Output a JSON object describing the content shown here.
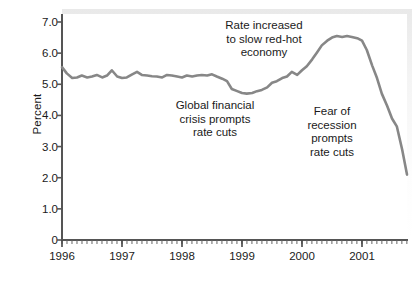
{
  "chart_data": {
    "type": "line",
    "title": "",
    "xlabel": "",
    "ylabel": "Percent",
    "xlim": [
      1996.0,
      2001.75
    ],
    "ylim": [
      0,
      7.0
    ],
    "grid": false,
    "legend": null,
    "line_color": "#878787",
    "y_ticks": [
      0,
      1.0,
      2.0,
      3.0,
      4.0,
      5.0,
      6.0,
      7.0
    ],
    "y_tick_labels": [
      "0",
      "1.0",
      "2.0",
      "3.0",
      "4.0",
      "5.0",
      "6.0",
      "7.0"
    ],
    "x_ticks": [
      1996,
      1997,
      1998,
      1999,
      2000,
      2001
    ],
    "x_tick_labels": [
      "1996",
      "1997",
      "1998",
      "1999",
      "2000",
      "2001"
    ],
    "x_minor_tick_interval": 0.0833,
    "series": [
      {
        "name": "Interest rate",
        "x": [
          1996.0,
          1996.08,
          1996.17,
          1996.25,
          1996.33,
          1996.42,
          1996.5,
          1996.58,
          1996.67,
          1996.75,
          1996.83,
          1996.92,
          1997.0,
          1997.08,
          1997.17,
          1997.25,
          1997.33,
          1997.42,
          1997.5,
          1997.58,
          1997.67,
          1997.75,
          1997.83,
          1997.92,
          1998.0,
          1998.08,
          1998.17,
          1998.25,
          1998.33,
          1998.42,
          1998.5,
          1998.58,
          1998.67,
          1998.75,
          1998.83,
          1998.92,
          1999.0,
          1999.08,
          1999.17,
          1999.25,
          1999.33,
          1999.42,
          1999.5,
          1999.58,
          1999.67,
          1999.75,
          1999.83,
          1999.92,
          2000.0,
          2000.08,
          2000.17,
          2000.25,
          2000.33,
          2000.42,
          2000.5,
          2000.58,
          2000.67,
          2000.75,
          2000.83,
          2000.92,
          2001.0,
          2001.08,
          2001.17,
          2001.25,
          2001.33,
          2001.42,
          2001.5,
          2001.58,
          2001.67,
          2001.75
        ],
        "y": [
          5.55,
          5.35,
          5.2,
          5.22,
          5.28,
          5.22,
          5.25,
          5.3,
          5.22,
          5.28,
          5.45,
          5.25,
          5.2,
          5.22,
          5.32,
          5.4,
          5.3,
          5.28,
          5.26,
          5.25,
          5.22,
          5.3,
          5.28,
          5.25,
          5.22,
          5.28,
          5.25,
          5.28,
          5.3,
          5.28,
          5.32,
          5.25,
          5.18,
          5.1,
          4.85,
          4.78,
          4.72,
          4.7,
          4.72,
          4.78,
          4.82,
          4.9,
          5.05,
          5.1,
          5.2,
          5.25,
          5.4,
          5.3,
          5.45,
          5.58,
          5.8,
          6.02,
          6.25,
          6.4,
          6.5,
          6.55,
          6.52,
          6.55,
          6.52,
          6.48,
          6.4,
          6.1,
          5.6,
          5.2,
          4.7,
          4.3,
          3.9,
          3.65,
          2.9,
          2.1
        ],
        "color": "#878787",
        "width": 2.6
      }
    ],
    "annotations": [
      {
        "id": "annotation-rate-increase",
        "text": "Rate increased\nto slow red-hot\neconomy",
        "left_px": 208,
        "top_px": 19,
        "width_px": 112
      },
      {
        "id": "annotation-global-financial-crisis",
        "text": "Global financial\ncrisis prompts\nrate cuts",
        "left_px": 163,
        "top_px": 99,
        "width_px": 104
      },
      {
        "id": "annotation-fear-of-recession",
        "text": "Fear of\nrecession\nprompts\nrate cuts",
        "left_px": 296,
        "top_px": 105,
        "width_px": 72
      }
    ]
  }
}
